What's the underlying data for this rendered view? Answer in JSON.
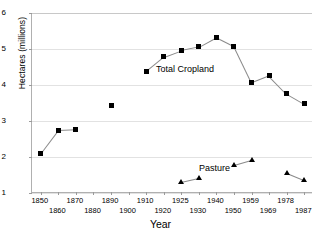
{
  "chart_data": {
    "type": "line",
    "title": "",
    "xlabel": "Year",
    "ylabel": "Hectares (millions)",
    "ylim": [
      1,
      6
    ],
    "yticks": [
      6,
      5,
      4,
      3,
      2,
      1
    ],
    "grid": true,
    "legend_position": "inline-annotation",
    "categories": [
      "1850",
      "1860",
      "1870",
      "1880",
      "1890",
      "1900",
      "1910",
      "1920",
      "1925",
      "1930",
      "1940",
      "1950",
      "1959",
      "1969",
      "1978",
      "1987"
    ],
    "x_tick_labels_row0": [
      "1850",
      "1870",
      "1890",
      "1910",
      "1925",
      "1940",
      "1959",
      "1978"
    ],
    "x_tick_labels_row1": [
      "1860",
      "1880",
      "1900",
      "1920",
      "1930",
      "1950",
      "1969",
      "1987"
    ],
    "series": [
      {
        "name": "Total Cropland",
        "marker": "square",
        "color": "#000000",
        "annotation": "Total Cropland",
        "points": [
          {
            "x": "1850",
            "y": 2.1
          },
          {
            "x": "1860",
            "y": 2.75
          },
          {
            "x": "1870",
            "y": 2.77
          },
          {
            "x": "1890",
            "y": 3.42
          },
          {
            "x": "1910",
            "y": 4.38
          },
          {
            "x": "1920",
            "y": 4.78
          },
          {
            "x": "1925",
            "y": 4.96
          },
          {
            "x": "1930",
            "y": 5.06
          },
          {
            "x": "1940",
            "y": 5.33
          },
          {
            "x": "1950",
            "y": 5.08
          },
          {
            "x": "1959",
            "y": 4.07
          },
          {
            "x": "1969",
            "y": 4.26
          },
          {
            "x": "1978",
            "y": 3.76
          },
          {
            "x": "1987",
            "y": 3.48
          }
        ],
        "connected_segments": [
          [
            0,
            1,
            2
          ],
          [
            3
          ],
          [
            4,
            5,
            6,
            7,
            8,
            9,
            10,
            11,
            12,
            13
          ]
        ]
      },
      {
        "name": "Pasture",
        "marker": "triangle",
        "color": "#000000",
        "annotation": "Pasture",
        "points": [
          {
            "x": "1925",
            "y": 1.31
          },
          {
            "x": "1930",
            "y": 1.42
          },
          {
            "x": "1950",
            "y": 1.79
          },
          {
            "x": "1959",
            "y": 1.93
          },
          {
            "x": "1978",
            "y": 1.55
          },
          {
            "x": "1987",
            "y": 1.35
          }
        ],
        "connected_segments": [
          [
            0,
            1
          ],
          [
            2,
            3
          ],
          [
            4,
            5
          ]
        ]
      }
    ]
  }
}
